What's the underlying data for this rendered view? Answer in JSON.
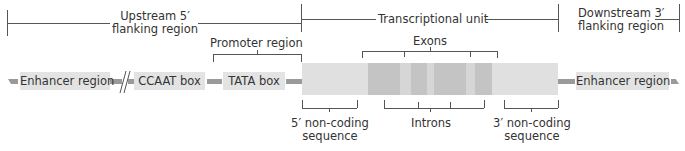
{
  "top_regions": [
    {
      "id": "upstream",
      "label_line1": "Upstream 5′",
      "label_line2": "flanking region"
    },
    {
      "id": "transcriptional",
      "label_line1": "Transcriptional unit"
    },
    {
      "id": "downstream",
      "label_line1": "Downstream 3′",
      "label_line2": "flanking region"
    }
  ],
  "promoter": {
    "label": "Promoter region"
  },
  "exons": {
    "label": "Exons",
    "count": 4
  },
  "introns": {
    "label": "Introns",
    "count": 3
  },
  "elements": [
    {
      "id": "enhancer-left",
      "label": "Enhancer region"
    },
    {
      "id": "ccaat",
      "label": "CCAAT box"
    },
    {
      "id": "tata",
      "label": "TATA box"
    },
    {
      "id": "enhancer-right",
      "label": "Enhancer region"
    }
  ],
  "noncoding": {
    "five_prime": {
      "line1": "5′ non-coding",
      "line2": "sequence"
    },
    "three_prime": {
      "line1": "3′ non-coding",
      "line2": "sequence"
    }
  },
  "colors": {
    "gene_body": "#e0e0e0",
    "exon": "#c4c4c4",
    "intron": "#d8d8d8",
    "element_box": "#e3e3e3",
    "dna_line": "#9a9a9a",
    "bracket": "#555555"
  },
  "break_symbol": "//"
}
